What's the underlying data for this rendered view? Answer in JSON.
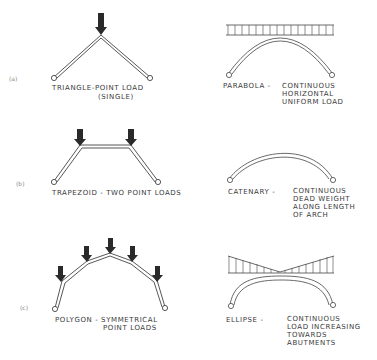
{
  "rows": [
    {
      "id": "a",
      "row_label": "(a)",
      "left": {
        "shape": "triangle",
        "caption_line1": "TRIANGLE-POINT LOAD",
        "caption_line2": "(SINGLE)",
        "point_loads": 1
      },
      "right": {
        "shape": "parabola",
        "caption_title": "PARABOLA -",
        "caption_lines": [
          "CONTINUOUS",
          "HORIZONTAL",
          "UNIFORM LOAD"
        ],
        "load_type": "uniform"
      }
    },
    {
      "id": "b",
      "row_label": "(b)",
      "left": {
        "shape": "trapezoid",
        "caption_line1": "TRAPEZOID - TWO POINT LOADS",
        "caption_line2": "",
        "point_loads": 2
      },
      "right": {
        "shape": "catenary",
        "caption_title": "CATENARY -",
        "caption_lines": [
          "CONTINUOUS",
          "DEAD WEIGHT",
          "ALONG LENGTH",
          "OF ARCH"
        ],
        "load_type": "none"
      }
    },
    {
      "id": "c",
      "row_label": "(c)",
      "left": {
        "shape": "polygon",
        "caption_line1": "POLYGON - SYMMETRICAL",
        "caption_line2": "POINT LOADS",
        "point_loads": 5
      },
      "right": {
        "shape": "ellipse",
        "caption_title": "ELLIPSE -",
        "caption_lines": [
          "CONTINUOUS",
          "LOAD INCREASING",
          "TOWARDS",
          "ABUTMENTS"
        ],
        "load_type": "increasing-to-ends"
      }
    }
  ],
  "colors": {
    "ink": "#3a3a3a",
    "arrow": "#2a2a2a",
    "background": "#ffffff"
  }
}
